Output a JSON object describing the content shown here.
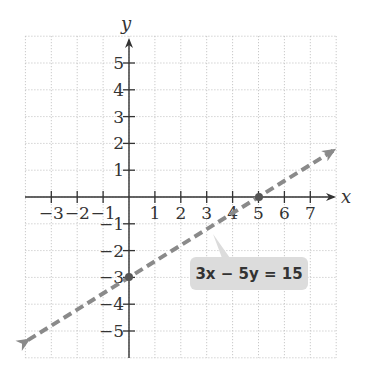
{
  "chart_data": {
    "type": "line",
    "title": "",
    "xlabel": "x",
    "ylabel": "y",
    "xlim": [
      -4,
      8
    ],
    "ylim": [
      -6,
      6
    ],
    "grid": true,
    "x_ticks": [
      "-3",
      "-2",
      "-1",
      "1",
      "2",
      "3",
      "4",
      "5",
      "6",
      "7"
    ],
    "y_ticks": [
      "5",
      "4",
      "3",
      "2",
      "1",
      "-1",
      "-2",
      "-3",
      "-4",
      "-5"
    ],
    "series": [
      {
        "name": "3x - 5y = 15",
        "style": "dashed",
        "color": "#888888",
        "equation": "3x − 5y = 15",
        "x": [
          -3.9,
          7.9
        ],
        "y": [
          -5.34,
          1.74
        ],
        "intercepts": [
          {
            "x": 5,
            "y": 0
          },
          {
            "x": 0,
            "y": -3
          }
        ]
      }
    ],
    "annotations": [
      {
        "text": "3x − 5y = 15",
        "points_to": "line"
      }
    ]
  },
  "labels": {
    "x_axis": "x",
    "y_axis": "y",
    "equation": "3x − 5y = 15"
  },
  "colors": {
    "line": "#8a8a8a",
    "label_box": "#dcdcdc",
    "axis": "#333333",
    "grid": "#bdbdbd"
  }
}
